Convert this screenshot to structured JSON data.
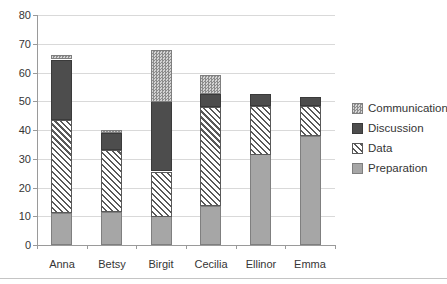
{
  "chart_data": {
    "type": "bar",
    "stacked": true,
    "title": "",
    "xlabel": "",
    "ylabel": "",
    "grid": true,
    "categories": [
      "Anna",
      "Betsy",
      "Birgit",
      "Cecilia",
      "Ellinor",
      "Emma"
    ],
    "series": [
      {
        "name": "Preparation",
        "values": [
          11,
          11.5,
          10,
          13.5,
          31.5,
          38
        ],
        "color": "#a6a6a6",
        "pattern": "solid-medium-gray"
      },
      {
        "name": "Data",
        "values": [
          32.5,
          21.5,
          15.5,
          34.5,
          17,
          10.5
        ],
        "color": "#595959",
        "pattern": "diagonal-hatch-on-white"
      },
      {
        "name": "Discussion",
        "values": [
          21,
          6,
          24.5,
          4.5,
          4,
          3
        ],
        "color": "#4d4d4d",
        "pattern": "solid-dark-gray"
      },
      {
        "name": "Communication",
        "values": [
          1.5,
          1,
          18,
          6.5,
          0,
          0
        ],
        "color": "#c9c9c9",
        "pattern": "checker-dots-light-gray"
      }
    ],
    "totals": [
      66,
      40,
      68,
      59,
      52.5,
      51.5
    ],
    "y_axis": {
      "min": 0,
      "max": 80,
      "tick_interval": 10,
      "tick_labels": [
        "0",
        "10",
        "20",
        "30",
        "40",
        "50",
        "60",
        "70",
        "80"
      ]
    },
    "legend": {
      "position": "right",
      "entries": [
        "Communication",
        "Discussion",
        "Data",
        "Preparation"
      ]
    },
    "colors": {
      "gridline": "#d9d9d9",
      "axis": "#9a9a9a",
      "label_text": "#353535",
      "background": "#ffffff"
    }
  }
}
